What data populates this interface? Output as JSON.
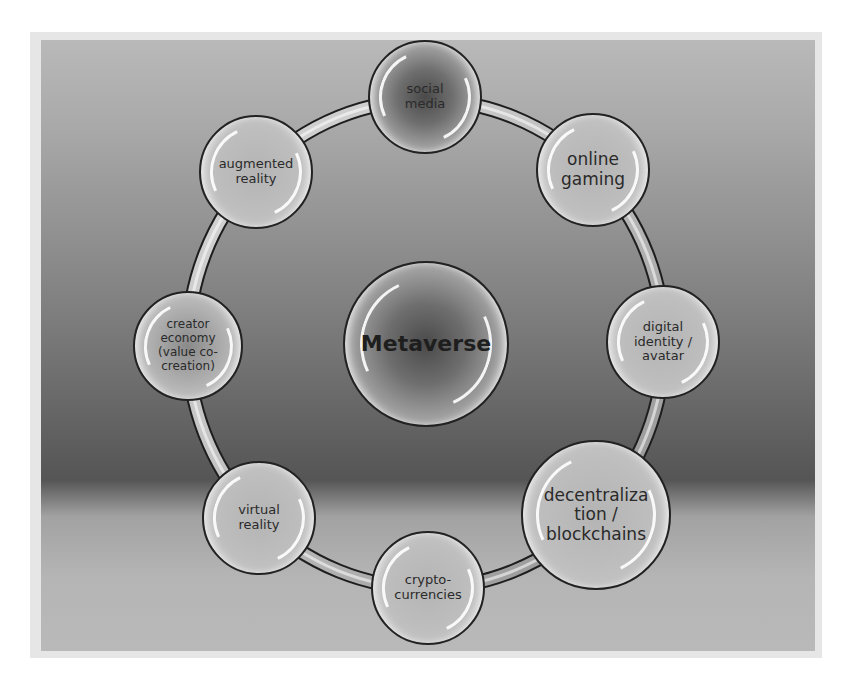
{
  "diagram": {
    "type": "hub-and-ring",
    "center": {
      "label": "Metaverse",
      "x": 426,
      "y": 344,
      "r": 83
    },
    "ring": {
      "cx": 426,
      "cy": 344,
      "rx": 238,
      "ry": 244
    },
    "nodes": [
      {
        "id": "social-media",
        "label": "social\nmedia",
        "x": 425,
        "y": 97,
        "r": 57,
        "style": "dark",
        "font": 13
      },
      {
        "id": "online-gaming",
        "label": "online\ngaming",
        "x": 593,
        "y": 170,
        "r": 57,
        "style": "light",
        "font": 17
      },
      {
        "id": "digital-identity-avatar",
        "label": "digital\nidentity /\navatar",
        "x": 663,
        "y": 342,
        "r": 57,
        "style": "light",
        "font": 13
      },
      {
        "id": "decentralization-blockchains",
        "label": "decentraliza\ntion /\nblockchains",
        "x": 596,
        "y": 515,
        "r": 75,
        "style": "light",
        "font": 17
      },
      {
        "id": "crypto-currencies",
        "label": "crypto-\ncurrencies",
        "x": 428,
        "y": 588,
        "r": 57,
        "style": "light",
        "font": 13
      },
      {
        "id": "virtual-reality",
        "label": "virtual\nreality",
        "x": 259,
        "y": 518,
        "r": 57,
        "style": "light",
        "font": 13
      },
      {
        "id": "creator-economy",
        "label": "creator\neconomy\n(value co-\ncreation)",
        "x": 188,
        "y": 346,
        "r": 55,
        "style": "normal",
        "font": 12
      },
      {
        "id": "augmented-reality",
        "label": "augmented\nreality",
        "x": 256,
        "y": 172,
        "r": 57,
        "style": "light",
        "font": 13
      }
    ]
  },
  "colors": {
    "panel_top": "#b9b9b9",
    "panel_dark": "#555555",
    "outline": "#222222",
    "text": "#2a2a2a",
    "ring_fill": "#c4c4c4"
  }
}
